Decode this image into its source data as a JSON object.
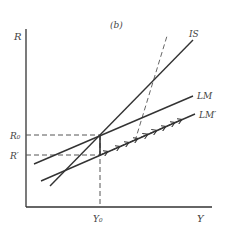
{
  "panel_label": "(b)",
  "axes": {
    "y_label": "R",
    "x_label": "Y"
  },
  "ticks": {
    "y0_label": "Y₀",
    "r0_label": "R₀",
    "rprime_label": "R′"
  },
  "curves": {
    "is_label": "IS",
    "lm_label": "LM",
    "lmprime_label": "LM′"
  },
  "colors": {
    "line": "#333333",
    "dashed": "#555555",
    "text": "#444444"
  }
}
